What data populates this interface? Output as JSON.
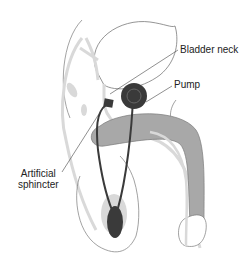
{
  "diagram": {
    "labels": {
      "bladder_neck": "Bladder neck",
      "pump": "Pump",
      "artificial_sphincter_line1": "Artificial",
      "artificial_sphincter_line2": "sphincter"
    },
    "colors": {
      "outline": "#7a7a7a",
      "light_fill": "#d9d9d9",
      "penis_fill": "#a8a8a8",
      "device": "#3a3a3a",
      "pump_inner": "#555555"
    }
  }
}
